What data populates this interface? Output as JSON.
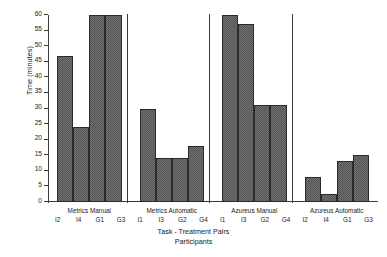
{
  "chart_data": {
    "type": "bar",
    "title": "",
    "xlabel": "Task - Treatment Pairs",
    "xlabel2": "Participants",
    "ylabel": "Time (minutes)",
    "ylim": [
      0,
      60
    ],
    "ytick_values": [
      0,
      5,
      10,
      15,
      20,
      25,
      30,
      35,
      40,
      45,
      50,
      55,
      60
    ],
    "ytick_labels": [
      "0",
      "5",
      "10",
      "15",
      "20",
      "25",
      "30",
      "35",
      "40",
      "45",
      "50",
      "55",
      "60"
    ],
    "grid": false,
    "legend": null,
    "bar_color": "#565656",
    "bar_edge_color": "#2b2b2b",
    "axis_color": "#3a3a3a",
    "groups": [
      {
        "name": "Metrics Manual",
        "participants": [
          "I2",
          "I4",
          "G1",
          "G3"
        ],
        "values": [
          47,
          24,
          60,
          60
        ]
      },
      {
        "name": "Metrics Automatic",
        "participants": [
          "I1",
          "I3",
          "G2",
          "G4"
        ],
        "values": [
          30,
          14,
          14,
          18
        ]
      },
      {
        "name": "Azureus Manual",
        "participants": [
          "I1",
          "I3",
          "G2",
          "G4"
        ],
        "values": [
          60,
          57,
          31,
          31
        ]
      },
      {
        "name": "Azureus Automatic",
        "participants": [
          "I2",
          "I4",
          "G1",
          "G3"
        ],
        "values": [
          8,
          2.5,
          13,
          15
        ]
      }
    ]
  }
}
